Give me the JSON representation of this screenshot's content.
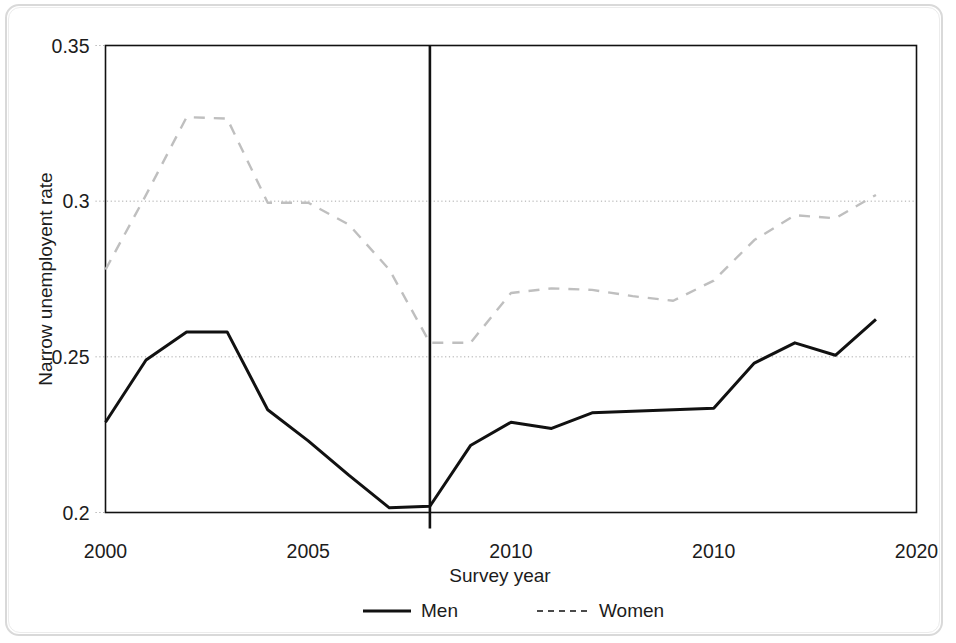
{
  "chart_data": {
    "type": "line",
    "title": "",
    "xlabel": "Survey year",
    "ylabel": "Narrow unemployent rate",
    "xlim": [
      2000,
      2020
    ],
    "ylim": [
      0.2,
      0.35
    ],
    "grid": true,
    "gridlines_y": [
      0.2,
      0.25,
      0.3,
      0.35
    ],
    "xticks": [
      2000,
      2005,
      2010,
      2015,
      2020
    ],
    "xtick_labels": [
      "2000",
      "2005",
      "2010",
      "2010",
      "2020"
    ],
    "yticks": [
      0.2,
      0.25,
      0.3,
      0.35
    ],
    "ytick_labels": [
      "0.2",
      "0.25",
      "0.3",
      "0.35"
    ],
    "legend_position": "below",
    "annotations": [
      {
        "name": "structural-break-line",
        "type": "vertical-line",
        "x": 2008,
        "style": "solid",
        "color": "#111111"
      }
    ],
    "x": [
      2000,
      2001,
      2002,
      2003,
      2004,
      2005,
      2006,
      2007,
      2008,
      2009,
      2010,
      2011,
      2012,
      2013,
      2014,
      2015,
      2016,
      2017,
      2018,
      2019
    ],
    "series": [
      {
        "name": "Men",
        "style": "solid",
        "color": "#111111",
        "values": [
          0.229,
          0.249,
          0.258,
          0.258,
          0.233,
          0.223,
          0.212,
          0.2015,
          0.202,
          0.2215,
          0.229,
          0.227,
          0.232,
          0.2325,
          0.233,
          0.2335,
          0.248,
          0.2545,
          0.2505,
          0.262
        ]
      },
      {
        "name": "Women",
        "style": "dashed",
        "color": "#bfbfbf",
        "values": [
          0.278,
          0.302,
          0.327,
          0.3265,
          0.2995,
          0.2995,
          0.2925,
          0.278,
          0.2545,
          0.2545,
          0.2705,
          0.272,
          0.2715,
          0.2695,
          0.268,
          0.2745,
          0.2875,
          0.2955,
          0.2945,
          0.302
        ]
      }
    ]
  },
  "legend": {
    "items": [
      {
        "label": "Men",
        "style": "solid"
      },
      {
        "label": "Women",
        "style": "dashed"
      }
    ]
  }
}
